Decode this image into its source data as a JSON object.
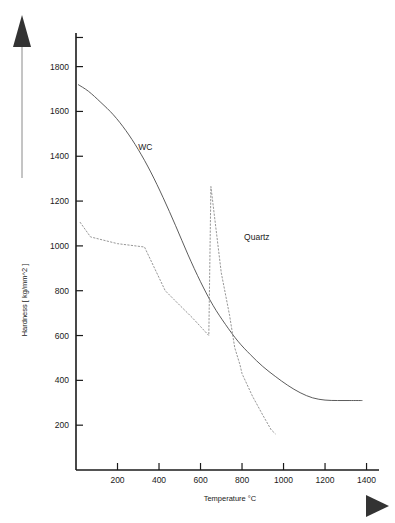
{
  "figure": {
    "name": "hardness-vs-temperature-chart",
    "background_color": "#ffffff",
    "ink_color": "#1a1a1a"
  },
  "icons": {
    "y_axis_arrow": "up-arrow-icon",
    "x_axis_arrow": "right-arrow-icon"
  },
  "chart_data": {
    "type": "line",
    "title": "",
    "subtitle": "",
    "xlabel": "Temperature °C",
    "ylabel": "Hardness [ kg/mm^2 ]",
    "xlim": [
      0,
      1460
    ],
    "ylim": [
      0,
      1950
    ],
    "xticks": [
      200,
      400,
      600,
      800,
      1000,
      1200,
      1400
    ],
    "yticks": [
      200,
      400,
      600,
      800,
      1000,
      1200,
      1400,
      1600,
      1800
    ],
    "xtick_labels": [
      "200",
      "400",
      "600",
      "800",
      "1000",
      "1200",
      "1400"
    ],
    "ytick_labels": [
      "200",
      "400",
      "600",
      "800",
      "1000",
      "1200",
      "1400",
      "1600",
      "1800"
    ],
    "grid": false,
    "legend": "inline-annotations",
    "legend_position": "in-plot",
    "annotations": [
      {
        "text": "WC",
        "x": 300,
        "y": 1430
      },
      {
        "text": "Quartz",
        "x": 810,
        "y": 1025
      }
    ],
    "series": [
      {
        "name": "WC",
        "style": "solid",
        "color": "#4a4a4a",
        "points": [
          {
            "x": 10,
            "y": 1720
          },
          {
            "x": 60,
            "y": 1690
          },
          {
            "x": 120,
            "y": 1640
          },
          {
            "x": 180,
            "y": 1585
          },
          {
            "x": 240,
            "y": 1515
          },
          {
            "x": 300,
            "y": 1430
          },
          {
            "x": 360,
            "y": 1330
          },
          {
            "x": 420,
            "y": 1215
          },
          {
            "x": 480,
            "y": 1090
          },
          {
            "x": 540,
            "y": 960
          },
          {
            "x": 600,
            "y": 840
          },
          {
            "x": 660,
            "y": 735
          },
          {
            "x": 720,
            "y": 650
          },
          {
            "x": 780,
            "y": 575
          },
          {
            "x": 840,
            "y": 515
          },
          {
            "x": 900,
            "y": 462
          },
          {
            "x": 960,
            "y": 418
          },
          {
            "x": 1020,
            "y": 378
          },
          {
            "x": 1080,
            "y": 345
          },
          {
            "x": 1140,
            "y": 322
          },
          {
            "x": 1200,
            "y": 312
          },
          {
            "x": 1260,
            "y": 310
          },
          {
            "x": 1320,
            "y": 310
          },
          {
            "x": 1380,
            "y": 310
          }
        ]
      },
      {
        "name": "Quartz",
        "style": "dotted",
        "color": "#8a8a8a",
        "points": [
          {
            "x": 20,
            "y": 1105
          },
          {
            "x": 70,
            "y": 1040
          },
          {
            "x": 200,
            "y": 1010
          },
          {
            "x": 330,
            "y": 995
          },
          {
            "x": 430,
            "y": 800
          },
          {
            "x": 500,
            "y": 735
          },
          {
            "x": 560,
            "y": 680
          },
          {
            "x": 600,
            "y": 640
          },
          {
            "x": 640,
            "y": 600
          },
          {
            "x": 650,
            "y": 1265
          },
          {
            "x": 700,
            "y": 880
          },
          {
            "x": 740,
            "y": 690
          },
          {
            "x": 765,
            "y": 545
          },
          {
            "x": 790,
            "y": 470
          },
          {
            "x": 800,
            "y": 430
          },
          {
            "x": 850,
            "y": 330
          },
          {
            "x": 900,
            "y": 245
          },
          {
            "x": 940,
            "y": 180
          },
          {
            "x": 960,
            "y": 162
          }
        ]
      }
    ]
  }
}
